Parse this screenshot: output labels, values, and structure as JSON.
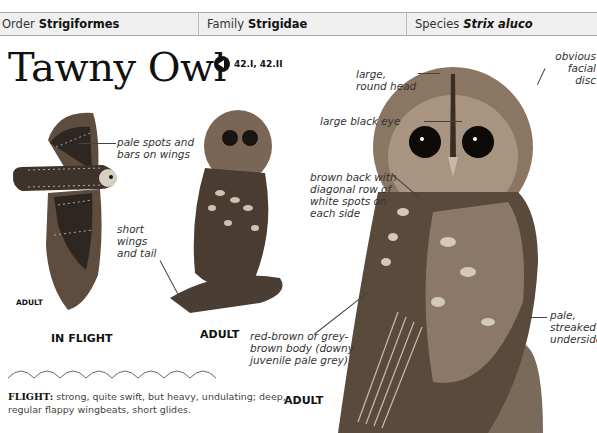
{
  "taxonomy": {
    "order_label": "Order",
    "order_value": "Strigiformes",
    "family_label": "Family",
    "family_value": "Strigidae",
    "species_label": "Species",
    "species_value": "Strix aluco"
  },
  "title": "Tawny Owl",
  "audio": {
    "icon": "speaker-icon",
    "codes": "42.I, 42.II"
  },
  "flight_figure": {
    "caption": "IN FLIGHT",
    "age_label": "ADULT",
    "annotations": {
      "pale_spots": "pale spots and bars on wings",
      "short_wings": "short wings and tail"
    }
  },
  "perched_small": {
    "caption": "ADULT"
  },
  "perched_large": {
    "caption": "ADULT",
    "annotations": {
      "round_head": "large, round head",
      "facial_disc": "obvious facial disc",
      "black_eye": "large black eye",
      "brown_back": "brown back with diagonal row of white spots on each side",
      "body_color": "red-brown or grey-brown body (downy juvenile pale grey)",
      "underside": "pale, streaked underside"
    }
  },
  "flight": {
    "heading": "FLIGHT:",
    "description": "strong, quite swift, but heavy, undulating; deep, regular flappy wingbeats, short glides."
  },
  "colors": {
    "header_bg": "#efefef",
    "text": "#222222",
    "owl_brown": "#5a4a3c"
  }
}
